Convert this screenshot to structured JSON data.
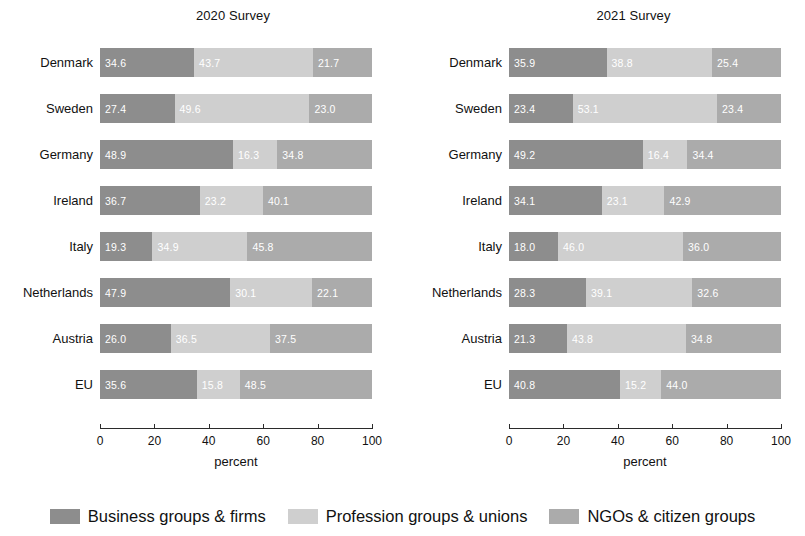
{
  "chart_data": {
    "type": "bar",
    "subtype": "horizontal stacked bar, 100% composition",
    "title": "",
    "xlabel": "percent",
    "ylabel": "",
    "xlim": [
      0,
      100
    ],
    "xticks": [
      0,
      20,
      40,
      60,
      80,
      100
    ],
    "xtick_labels": [
      "0",
      "20",
      "40",
      "60",
      "80",
      "100"
    ],
    "grid": false,
    "legend_position": "bottom-center",
    "categories": [
      "Denmark",
      "Sweden",
      "Germany",
      "Ireland",
      "Italy",
      "Netherlands",
      "Austria",
      "EU"
    ],
    "series_names": [
      "Business groups & firms",
      "Profession groups & unions",
      "NGOs & citizen groups"
    ],
    "series_colors": [
      "#8d8d8d",
      "#cfcfcf",
      "#ababab"
    ],
    "panels": [
      {
        "title": "2020 Survey",
        "series": [
          {
            "name": "Business groups & firms",
            "values": [
              34.6,
              27.4,
              48.9,
              36.7,
              19.3,
              47.9,
              26.0,
              35.6
            ]
          },
          {
            "name": "Profession groups & unions",
            "values": [
              43.7,
              49.6,
              16.3,
              23.2,
              34.9,
              30.1,
              36.5,
              15.8
            ]
          },
          {
            "name": "NGOs & citizen groups",
            "values": [
              21.7,
              23.0,
              34.8,
              40.1,
              45.8,
              22.1,
              37.5,
              48.5
            ]
          }
        ]
      },
      {
        "title": "2021 Survey",
        "series": [
          {
            "name": "Business groups & firms",
            "values": [
              35.9,
              23.4,
              49.2,
              34.1,
              18.0,
              28.3,
              21.3,
              40.8
            ]
          },
          {
            "name": "Profession groups & unions",
            "values": [
              38.8,
              53.1,
              16.4,
              23.1,
              46.0,
              39.1,
              43.8,
              15.2
            ]
          },
          {
            "name": "NGOs & citizen groups",
            "values": [
              25.4,
              23.4,
              34.4,
              42.9,
              36.0,
              32.6,
              34.8,
              44.0
            ]
          }
        ]
      }
    ],
    "data_labels": {
      "2020 Survey": {
        "Denmark": [
          "34.6",
          "43.7",
          "21.7"
        ],
        "Sweden": [
          "27.4",
          "49.6",
          "23.0"
        ],
        "Germany": [
          "48.9",
          "16.3",
          "34.8"
        ],
        "Ireland": [
          "36.7",
          "23.2",
          "40.1"
        ],
        "Italy": [
          "19.3",
          "34.9",
          "45.8"
        ],
        "Netherlands": [
          "47.9",
          "30.1",
          "22.1"
        ],
        "Austria": [
          "26.0",
          "36.5",
          "37.5"
        ],
        "EU": [
          "35.6",
          "15.8",
          "48.5"
        ]
      },
      "2021 Survey": {
        "Denmark": [
          "35.9",
          "38.8",
          "25.4"
        ],
        "Sweden": [
          "23.4",
          "53.1",
          "23.4"
        ],
        "Germany": [
          "49.2",
          "16.4",
          "34.4"
        ],
        "Ireland": [
          "34.1",
          "23.1",
          "42.9"
        ],
        "Italy": [
          "18.0",
          "46.0",
          "36.0"
        ],
        "Netherlands": [
          "28.3",
          "39.1",
          "32.6"
        ],
        "Austria": [
          "21.3",
          "43.8",
          "34.8"
        ],
        "EU": [
          "40.8",
          "15.2",
          "44.0"
        ]
      }
    }
  },
  "legend": {
    "items": [
      {
        "label": "Business groups & firms",
        "color": "#8d8d8d",
        "swatch_class": "s0"
      },
      {
        "label": "Profession groups & unions",
        "color": "#cfcfcf",
        "swatch_class": "s1"
      },
      {
        "label": "NGOs & citizen groups",
        "color": "#ababab",
        "swatch_class": "s2"
      }
    ]
  }
}
